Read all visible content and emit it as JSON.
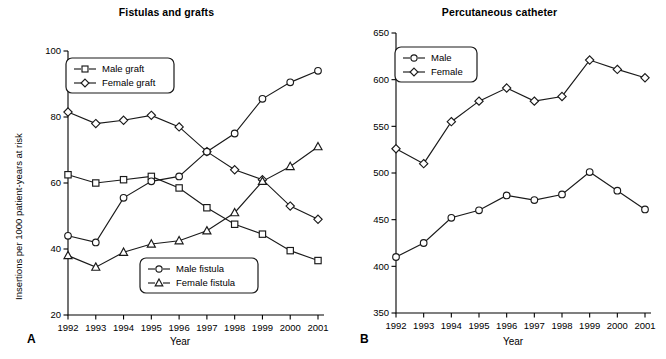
{
  "figure": {
    "panels": [
      {
        "letter": "A",
        "title": "Fistulas and grafts",
        "xlabel": "Year",
        "ylabel": "Insertions per 1000 patient-years at risk"
      },
      {
        "letter": "B",
        "title": "Percutaneous catheter",
        "xlabel": "Year",
        "ylabel": "Insertions per 1000 patient-years at risk"
      }
    ]
  },
  "chart_data": [
    {
      "type": "line",
      "title": "Fistulas and grafts",
      "xlabel": "Year",
      "ylabel": "Insertions per 1000 patient-years at risk",
      "panel": "A",
      "grid": false,
      "legend_position": "inside-upper-left and inside-lower-right",
      "categories": [
        "1992",
        "1993",
        "1994",
        "1995",
        "1996",
        "1997",
        "1998",
        "1999",
        "2000",
        "2001"
      ],
      "x": [
        1992,
        1993,
        1994,
        1995,
        1996,
        1997,
        1998,
        1999,
        2000,
        2001
      ],
      "xlim": [
        1992,
        2001
      ],
      "ylim": [
        20,
        100
      ],
      "yticks": [
        20,
        40,
        60,
        80,
        100
      ],
      "series": [
        {
          "name": "Male graft",
          "marker": "square",
          "values": [
            62.5,
            60.0,
            61.0,
            62.0,
            58.5,
            52.5,
            47.5,
            44.5,
            39.5,
            36.5
          ]
        },
        {
          "name": "Female graft",
          "marker": "diamond",
          "values": [
            81.5,
            78.0,
            79.0,
            80.5,
            77.0,
            69.5,
            64.0,
            61.0,
            53.0,
            49.0
          ]
        },
        {
          "name": "Male fistula",
          "marker": "circle",
          "values": [
            44.0,
            42.0,
            55.5,
            60.5,
            62.0,
            69.5,
            75.0,
            85.5,
            90.5,
            94.0
          ]
        },
        {
          "name": "Female fistula",
          "marker": "triangle",
          "values": [
            38.0,
            34.5,
            39.0,
            41.5,
            42.5,
            45.5,
            51.0,
            60.5,
            65.0,
            71.0
          ]
        }
      ],
      "legends": [
        {
          "entries": [
            "Male graft",
            "Female graft"
          ]
        },
        {
          "entries": [
            "Male fistula",
            "Female fistula"
          ]
        }
      ]
    },
    {
      "type": "line",
      "title": "Percutaneous catheter",
      "xlabel": "Year",
      "ylabel": "Insertions per 1000 patient-years at risk",
      "panel": "B",
      "grid": false,
      "legend_position": "inside-upper-left",
      "categories": [
        "1992",
        "1993",
        "1994",
        "1995",
        "1996",
        "1997",
        "1998",
        "1999",
        "2000",
        "2001"
      ],
      "x": [
        1992,
        1993,
        1994,
        1995,
        1996,
        1997,
        1998,
        1999,
        2000,
        2001
      ],
      "xlim": [
        1992,
        2001
      ],
      "ylim": [
        350,
        650
      ],
      "yticks": [
        350,
        400,
        450,
        500,
        550,
        600,
        650
      ],
      "series": [
        {
          "name": "Male",
          "marker": "circle",
          "values": [
            410,
            425,
            452,
            460,
            476,
            471,
            477,
            501,
            481,
            461
          ]
        },
        {
          "name": "Female",
          "marker": "diamond",
          "values": [
            526,
            510,
            555,
            577,
            591,
            577,
            582,
            621,
            611,
            602
          ]
        }
      ],
      "legends": [
        {
          "entries": [
            "Male",
            "Female"
          ]
        }
      ]
    }
  ]
}
